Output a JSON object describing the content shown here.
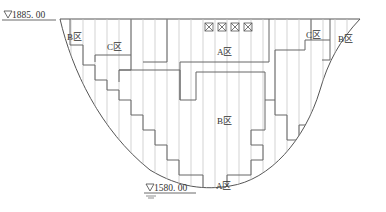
{
  "diagram": {
    "type": "dam-cross-section-zoning",
    "elevations": {
      "crest": "1885. 00",
      "bottom": "1580. 00"
    },
    "zones": [
      {
        "id": "B-left",
        "label": "B区"
      },
      {
        "id": "C-left",
        "label": "C区"
      },
      {
        "id": "A-top",
        "label": "A区"
      },
      {
        "id": "C-right",
        "label": "C区"
      },
      {
        "id": "B-right",
        "label": "B区"
      },
      {
        "id": "B-center",
        "label": "B区"
      },
      {
        "id": "A-bottom",
        "label": "A区"
      }
    ],
    "legend_boxes": [
      "⊠",
      "⊠",
      "⊠",
      "⊠"
    ],
    "colors": {
      "outline": "#555555",
      "grid": "#c8c8c8",
      "zone_line": "#666666"
    }
  }
}
